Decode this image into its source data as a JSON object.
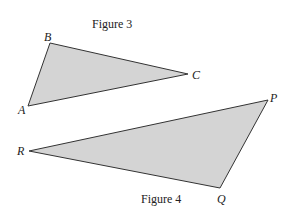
{
  "figures": [
    {
      "caption": "Figure 3",
      "vertices": {
        "A": [
          28,
          106
        ],
        "B": [
          50,
          43
        ],
        "C": [
          188,
          74
        ]
      }
    },
    {
      "caption": "Figure 4",
      "vertices": {
        "P": [
          268,
          100
        ],
        "Q": [
          220,
          188
        ],
        "R": [
          29,
          151
        ]
      }
    }
  ],
  "colors": {
    "fill": "#d4d4d4",
    "stroke": "#333333"
  }
}
